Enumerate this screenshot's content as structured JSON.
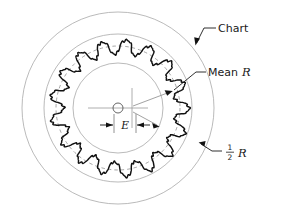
{
  "figure": {
    "kind": "roundness-chart-diagram",
    "background_color": "#ffffff",
    "ink_color": "#1a1a1a",
    "light_line_color": "#9a9a9a",
    "trace_color": "#111111",
    "center": {
      "x": 118,
      "y": 108
    }
  },
  "labels": {
    "chart": "Chart",
    "mean_r_prefix": "Mean ",
    "mean_r_symbol": "R",
    "half_r_numerator": "1",
    "half_r_denominator": "2",
    "half_r_symbol": "R",
    "eccentricity": "E"
  },
  "circles": [
    {
      "name": "outer-chart-circle",
      "radius": 96,
      "style": "thin-gray"
    },
    {
      "name": "half-r-circle",
      "radius": 74,
      "style": "thin-gray"
    },
    {
      "name": "inner-circle",
      "radius": 45,
      "style": "thin-gray"
    },
    {
      "name": "mean-r-circle",
      "radius": 62,
      "style": "dashed-gray"
    }
  ],
  "trace": {
    "name": "measured-roundness-trace",
    "lobe_count": 17,
    "mean_radius": 62,
    "lobe_amplitude": 7,
    "ripple_amplitude": 1.6,
    "ripple_count": 5,
    "center_offset_x": 2,
    "center_offset_y": 0
  },
  "center_mark": {
    "name": "chart-center-mark",
    "circle_radius": 5,
    "horizontal_line_half_length": 30,
    "vertical_line_offset_x": 14,
    "vertical_line_half_length": 20
  },
  "dimension_e": {
    "name": "eccentricity-dimension",
    "y": 125,
    "left_tick_x": 114,
    "right_tick_x": 136,
    "arrow_direction": "inward"
  },
  "leaders": [
    {
      "name": "chart-leader",
      "label": "Chart",
      "text_x": 218,
      "text_y": 32,
      "elbow_x": 212,
      "elbow_y": 28,
      "tip_x": 196,
      "tip_y": 44,
      "target": "outer-chart-circle"
    },
    {
      "name": "mean-r-leader",
      "label": "Mean R",
      "text_x": 208,
      "text_y": 76,
      "elbow_x": 204,
      "elbow_y": 72,
      "tip_x": 172,
      "tip_y": 92,
      "target": "mean-r-circle"
    },
    {
      "name": "half-r-leader",
      "label": "1/2 R",
      "text_x": 224,
      "text_y": 155,
      "elbow_x": 218,
      "elbow_y": 151,
      "tip_x": 200,
      "tip_y": 143,
      "target": "half-r-circle"
    }
  ]
}
